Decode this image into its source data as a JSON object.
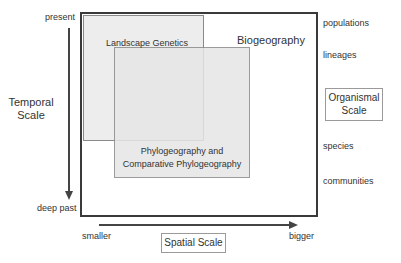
{
  "diagram": {
    "title": "",
    "temporal_axis": {
      "label": "Temporal Scale",
      "top": "present",
      "bottom": "deep past"
    },
    "spatial_axis": {
      "label": "Spatial Scale",
      "left": "smaller",
      "right": "bigger"
    },
    "organismal_axis": {
      "label": "Organismal Scale",
      "levels": [
        "populations",
        "lineages",
        "species",
        "communities"
      ]
    },
    "regions": [
      {
        "name": "Biogeography",
        "shaded": false
      },
      {
        "name": "Landscape Genetics",
        "shaded": true
      },
      {
        "name": "Phylogeography and Comparative Phylogeography",
        "line1": "Phylogeography and",
        "line2": "Comparative Phylogeography",
        "shaded": true
      }
    ],
    "colors": {
      "outer_border": "#3a3a3a",
      "inner_border": "#8a8a8a",
      "shading": "#e6e6e6",
      "text": "#333333"
    }
  }
}
